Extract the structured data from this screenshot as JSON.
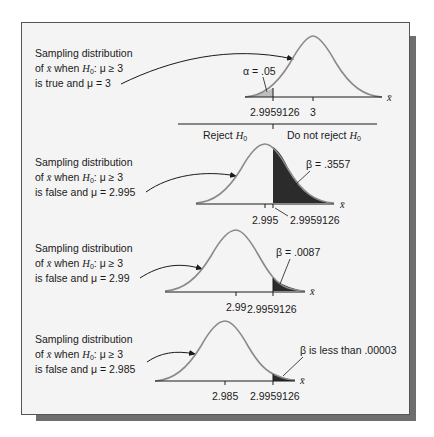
{
  "figure": {
    "panels": [
      {
        "id": "h0-true",
        "desc_lines": [
          "Sampling distribution",
          "of x̄ when H0: μ ≥ 3",
          "is true and μ = 3"
        ],
        "line1": "Sampling distribution",
        "line2_prefix": "of ",
        "xbar": "x̄",
        "line2_mid": " when ",
        "H": "H",
        "sub0": "0",
        "line2_suffix": ": μ ≥ 3",
        "line3": "is true and μ = 3",
        "area_label": "α = .05",
        "ticks": [
          "2.9959126",
          "3"
        ],
        "axis_label": "x̄"
      },
      {
        "id": "mu-2.995",
        "line1": "Sampling distribution",
        "line2_prefix": "of ",
        "xbar": "x̄",
        "line2_mid": " when ",
        "H": "H",
        "sub0": "0",
        "line2_suffix": ": μ ≥ 3",
        "line3": "is false and μ = 2.995",
        "area_label": "β = .3557",
        "ticks": [
          "2.995",
          "2.9959126"
        ],
        "axis_label": "x̄"
      },
      {
        "id": "mu-2.99",
        "line1": "Sampling distribution",
        "line2_prefix": "of ",
        "xbar": "x̄",
        "line2_mid": " when ",
        "H": "H",
        "sub0": "0",
        "line2_suffix": ": μ ≥ 3",
        "line3": "is false and μ = 2.99",
        "area_label": "β = .0087",
        "ticks": [
          "2.99",
          "2.9959126"
        ],
        "axis_label": "x̄"
      },
      {
        "id": "mu-2.985",
        "line1": "Sampling distribution",
        "line2_prefix": "of ",
        "xbar": "x̄",
        "line2_mid": " when ",
        "H": "H",
        "sub0": "0",
        "line2_suffix": ": μ ≥ 3",
        "line3": "is false and μ = 2.985",
        "area_label": "β is less than .00003",
        "ticks": [
          "2.985",
          "2.9959126"
        ],
        "axis_label": "x̄"
      }
    ],
    "regions": {
      "reject": "Reject ",
      "do_not_reject": "Do not reject ",
      "H": "H",
      "sub0": "0"
    },
    "colors": {
      "panel_bg": "#f4f4f4",
      "curve": "#8a8a8a",
      "alpha_fill": "#bdbdbd",
      "beta_fill": "#2b2b2b",
      "shadow": "#6e6e6e"
    }
  }
}
